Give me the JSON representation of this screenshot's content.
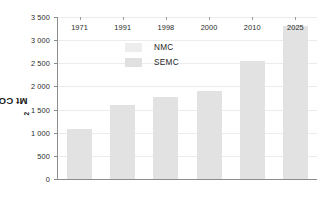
{
  "chart_data": {
    "type": "bar",
    "title": "",
    "subtitle": "",
    "xlabel": "",
    "ylabel": "Mt CO2",
    "ylabel_display": "Mt CO",
    "ylabel_subscript": "2",
    "categories": [
      "1971",
      "1991",
      "1998",
      "2000",
      "2010",
      "2025"
    ],
    "series": [
      {
        "name": "SEMC",
        "color": "#e2e2e2",
        "values": [
          1080,
          1590,
          1780,
          1910,
          2560,
          3300
        ]
      }
    ],
    "legend": [
      {
        "label": "NMC",
        "color": "#ededed"
      },
      {
        "label": "SEMC",
        "color": "#e0e0e0"
      }
    ],
    "legend_position": "top-left-inside",
    "ylim": [
      0,
      3500
    ],
    "ytick_values": [
      0,
      500,
      1000,
      1500,
      2000,
      2500,
      3000,
      3500
    ],
    "ytick_labels": [
      "0",
      "500",
      "1 000",
      "1 500",
      "2 000",
      "2 500",
      "3 000",
      "3 500"
    ],
    "grid": true,
    "grid_axis": "y",
    "grid_color": "#ececec",
    "axis_color": "#8c8c8c",
    "background": "#ffffff"
  }
}
